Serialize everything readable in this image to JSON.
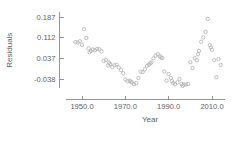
{
  "chart_data": {
    "type": "scatter",
    "title": "",
    "subtitle": "",
    "xlabel": "Year",
    "ylabel": "Residuals",
    "xlim": [
      1942.5,
      2016.0
    ],
    "ylim": [
      -0.072,
      0.205
    ],
    "grid": false,
    "legend": null,
    "annotations": [],
    "x_ticks": [
      1950.0,
      1970.0,
      1990.0,
      2010.0
    ],
    "x_tick_labels": [
      "1950.0",
      "1970.0",
      "1990.0",
      "2010.0"
    ],
    "y_ticks": [
      -0.038,
      0.037,
      0.112,
      0.187
    ],
    "y_tick_labels": [
      "-0.038",
      "0.037",
      "0.112",
      "0.187"
    ],
    "marker": {
      "shape": "circle",
      "open": true,
      "color": "#b4b4b4",
      "size": 1.7
    },
    "axis_color": "#8a8a8a",
    "text_color": "#5e5e5e",
    "background": "#ffffff",
    "series": [
      {
        "name": "residuals",
        "points": [
          [
            1948.0,
            0.094
          ],
          [
            1949.0,
            0.099
          ],
          [
            1950.0,
            0.086
          ],
          [
            1951.0,
            0.143
          ],
          [
            1952.0,
            0.111
          ],
          [
            1953.0,
            0.073
          ],
          [
            1954.0,
            0.064
          ],
          [
            1955.0,
            0.069
          ],
          [
            1956.0,
            0.066
          ],
          [
            1957.0,
            0.071
          ],
          [
            1958.0,
            0.07
          ],
          [
            1959.0,
            0.062
          ],
          [
            1960.0,
            0.028
          ],
          [
            1961.0,
            0.031
          ],
          [
            1962.0,
            0.011
          ],
          [
            1963.0,
            0.016
          ],
          [
            1964.0,
            0.005
          ],
          [
            1965.0,
            0.012
          ],
          [
            1966.0,
            0.014
          ],
          [
            1967.0,
            0.004
          ],
          [
            1968.0,
            -0.006
          ],
          [
            1969.0,
            -0.017
          ],
          [
            1970.0,
            -0.04
          ],
          [
            1971.0,
            -0.046
          ],
          [
            1972.0,
            -0.044
          ],
          [
            1973.0,
            -0.05
          ],
          [
            1974.0,
            -0.057
          ],
          [
            1975.0,
            -0.053
          ],
          [
            1976.0,
            -0.034
          ],
          [
            1977.0,
            -0.011
          ],
          [
            1978.0,
            -0.013
          ],
          [
            1979.0,
            -0.003
          ],
          [
            1980.0,
            0.01
          ],
          [
            1981.0,
            0.014
          ],
          [
            1982.0,
            0.022
          ],
          [
            1983.0,
            0.037
          ],
          [
            1984.0,
            0.047
          ],
          [
            1985.0,
            0.052
          ],
          [
            1986.0,
            0.044
          ],
          [
            1987.0,
            0.038
          ],
          [
            1988.0,
            -0.011
          ],
          [
            1989.0,
            -0.044
          ],
          [
            1990.0,
            -0.02
          ],
          [
            1991.0,
            -0.034
          ],
          [
            1992.0,
            -0.053
          ],
          [
            1993.0,
            -0.057
          ],
          [
            1994.0,
            -0.05
          ],
          [
            1995.0,
            -0.038
          ],
          [
            1996.0,
            -0.056
          ],
          [
            1997.0,
            -0.059
          ],
          [
            1998.0,
            -0.058
          ],
          [
            1999.0,
            -0.056
          ],
          [
            2000.0,
            0.023
          ],
          [
            2001.0,
            0.002
          ],
          [
            2002.0,
            0.038
          ],
          [
            2003.0,
            0.03
          ],
          [
            2004.0,
            0.064
          ],
          [
            2005.0,
            0.097
          ],
          [
            2006.0,
            0.113
          ],
          [
            2007.0,
            0.133
          ],
          [
            2008.0,
            0.18
          ],
          [
            2009.0,
            0.085
          ],
          [
            2010.0,
            0.068
          ],
          [
            2011.0,
            0.03
          ],
          [
            2012.0,
            -0.032
          ],
          [
            2013.0,
            0.034
          ],
          [
            2014.0,
            0.013
          ],
          [
            1947.0,
            0.096
          ],
          [
            1953.5,
            0.059
          ],
          [
            1962.5,
            0.021
          ],
          [
            1972.5,
            -0.048
          ],
          [
            1981.5,
            0.019
          ],
          [
            1986.5,
            0.04
          ],
          [
            1991.5,
            -0.046
          ],
          [
            1996.5,
            -0.063
          ],
          [
            2003.5,
            0.052
          ],
          [
            2009.5,
            0.077
          ]
        ]
      }
    ]
  }
}
